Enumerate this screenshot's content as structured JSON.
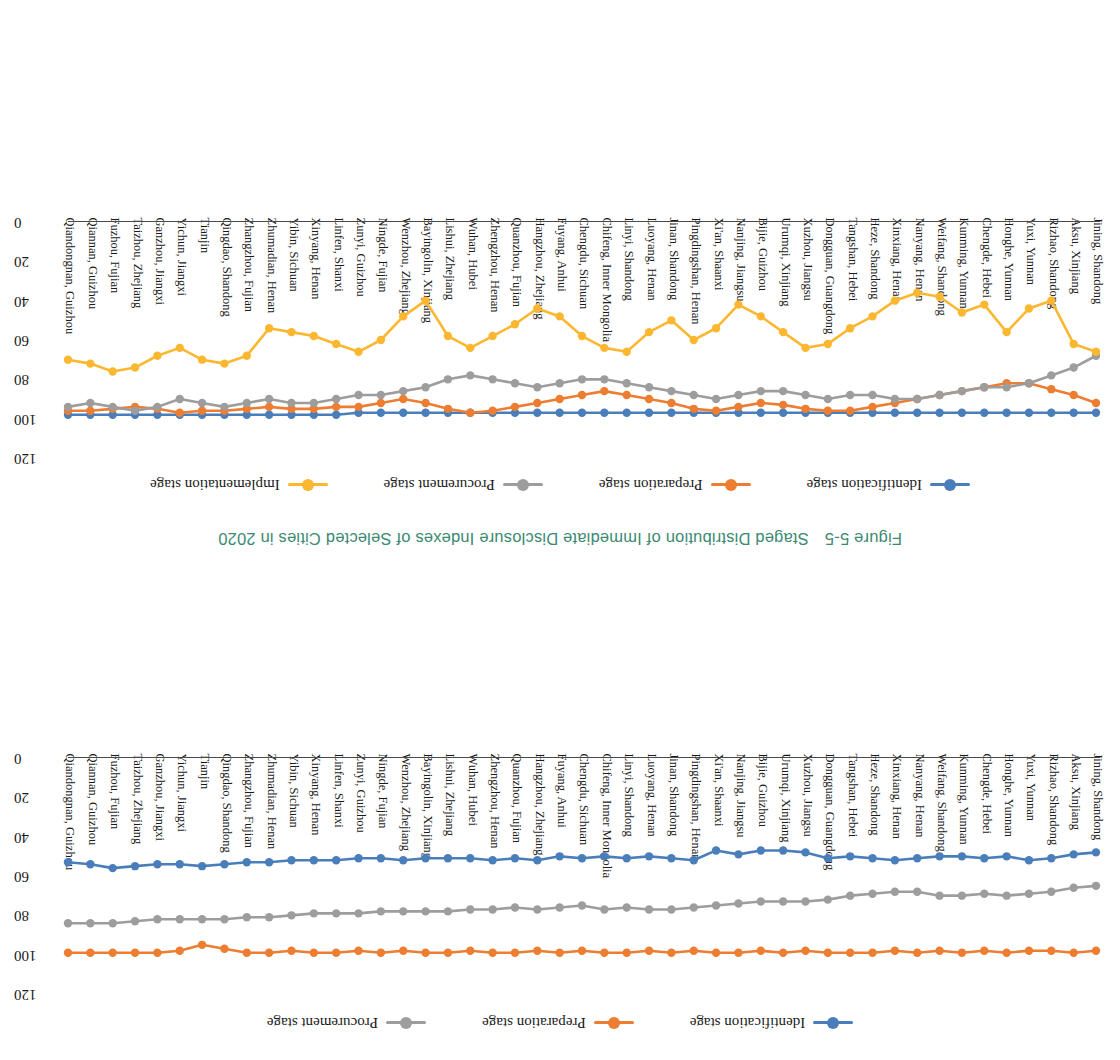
{
  "caption": {
    "number": "Figure 5-5",
    "title": "Staged Distribution of Immediate Disclosure Indexes of Selected Cities in 2020",
    "color": "#3c8a72"
  },
  "colors": {
    "identification": "#4a7ebb",
    "preparation": "#ed7d31",
    "procurement": "#9d9d9d",
    "implementation": "#fcb731"
  },
  "categories": [
    "Jining, Shandong",
    "Aksu, Xinjiang",
    "Rizhao, Shandong",
    "Yuxi, Yunnan",
    "Honghe, Yunnan",
    "Chengde, Hebei",
    "Kunming, Yunnan",
    "Weifang, Shandong",
    "Nanyang, Henan",
    "Xinxiang, Henan",
    "Heze, Shandong",
    "Tangshan, Hebei",
    "Dongguan, Guangdong",
    "Xuzhou, Jiangsu",
    "Urumqi, Xinjiang",
    "Bijie, Guizhou",
    "Nanjing, Jiangsu",
    "Xi'an, Shaanxi",
    "Pingdingshan, Henan",
    "Jinan, Shandong",
    "Luoyang, Henan",
    "Linyi, Shandong",
    "Chifeng, Inner Mongolia",
    "Chengdu, Sichuan",
    "Fuyang, Anhui",
    "Hangzhou, Zhejiang",
    "Quanzhou, Fujian",
    "Zhengzhou, Henan",
    "Wuhan, Hubei",
    "Lishui, Zhejiang",
    "Bayingolin, Xinjiang",
    "Wenzhou, Zhejiang",
    "Ningde, Fujian",
    "Zunyi, Guizhou",
    "Linfen, Shanxi",
    "Xinyang, Henan",
    "Yibin, Sichuan",
    "Zhumadian, Henan",
    "Zhangzhou, Fujian",
    "Qingdao, Shandong",
    "Tianjin",
    "Yichun, Jiangxi",
    "Ganzhou, Jiangxi",
    "Taizhou, Zhejiang",
    "Fuzhou, Fujian",
    "Qiannan, Guizhou",
    "Qiandongnan, Guizhou"
  ],
  "chart_data": [
    {
      "id": "top",
      "type": "line",
      "title": "",
      "xlabel": "",
      "ylabel": "",
      "ylim": [
        0,
        120
      ],
      "yticks": [
        0,
        20,
        40,
        60,
        80,
        100,
        120
      ],
      "grid": false,
      "legend_position": "top",
      "legend": [
        "Identification stage",
        "Preparation stage",
        "Procurement stage"
      ],
      "series": [
        {
          "name": "Identification stage",
          "color": "#4a7ebb",
          "values": [
            48,
            49,
            51,
            52,
            50,
            51,
            50,
            50,
            51,
            52,
            51,
            50,
            51,
            48,
            47,
            47,
            49,
            47,
            52,
            51,
            50,
            51,
            50,
            51,
            50,
            52,
            51,
            52,
            51,
            51,
            51,
            52,
            51,
            51,
            52,
            52,
            52,
            53,
            53,
            54,
            55,
            54,
            54,
            55,
            56,
            54,
            53
          ]
        },
        {
          "name": "Preparation stage",
          "color": "#ed7d31",
          "values": [
            98,
            99,
            98,
            98,
            99,
            98,
            99,
            98,
            99,
            98,
            99,
            99,
            99,
            98,
            99,
            98,
            99,
            99,
            98,
            99,
            98,
            99,
            99,
            98,
            99,
            98,
            99,
            99,
            98,
            99,
            99,
            98,
            99,
            98,
            99,
            99,
            98,
            99,
            99,
            97,
            95,
            98,
            99,
            99,
            99,
            99,
            99
          ]
        },
        {
          "name": "Procurement stage",
          "color": "#9d9d9d",
          "values": [
            65,
            66,
            68,
            69,
            70,
            69,
            70,
            70,
            68,
            68,
            69,
            70,
            72,
            73,
            73,
            73,
            74,
            75,
            76,
            77,
            77,
            76,
            77,
            75,
            76,
            77,
            76,
            77,
            77,
            78,
            78,
            78,
            78,
            79,
            79,
            79,
            80,
            81,
            81,
            82,
            82,
            82,
            82,
            83,
            84,
            84,
            84
          ]
        }
      ]
    },
    {
      "id": "bottom",
      "type": "line",
      "title": "",
      "xlabel": "",
      "ylabel": "",
      "ylim": [
        0,
        120
      ],
      "yticks": [
        0,
        20,
        40,
        60,
        80,
        100,
        120
      ],
      "grid": false,
      "legend_position": "top",
      "legend": [
        "Identification stage",
        "Preparation stage",
        "Procurement stage",
        "Implementation stage"
      ],
      "series": [
        {
          "name": "Identification stage",
          "color": "#4a7ebb",
          "values": [
            97,
            97,
            97,
            97,
            97,
            97,
            97,
            97,
            97,
            97,
            97,
            97,
            97,
            97,
            97,
            97,
            97,
            97,
            97,
            97,
            97,
            97,
            97,
            97,
            97,
            97,
            97,
            97,
            97,
            97,
            97,
            97,
            97,
            97,
            98,
            98,
            98,
            98,
            98,
            98,
            98,
            98,
            98,
            98,
            98,
            98,
            98
          ]
        },
        {
          "name": "Preparation stage",
          "color": "#ed7d31",
          "values": [
            92,
            88,
            85,
            82,
            82,
            84,
            86,
            88,
            90,
            92,
            94,
            96,
            96,
            95,
            93,
            92,
            94,
            96,
            95,
            92,
            90,
            88,
            86,
            88,
            90,
            92,
            94,
            96,
            97,
            95,
            92,
            90,
            92,
            94,
            94,
            95,
            95,
            94,
            95,
            96,
            96,
            97,
            95,
            94,
            95,
            96,
            96
          ]
        },
        {
          "name": "Procurement stage",
          "color": "#9d9d9d",
          "values": [
            68,
            74,
            78,
            82,
            84,
            84,
            86,
            88,
            90,
            90,
            88,
            88,
            90,
            88,
            86,
            86,
            88,
            90,
            88,
            86,
            84,
            82,
            80,
            80,
            82,
            84,
            82,
            80,
            78,
            80,
            84,
            86,
            88,
            88,
            90,
            92,
            92,
            90,
            92,
            94,
            92,
            90,
            94,
            96,
            94,
            92,
            94
          ]
        },
        {
          "name": "Implementation stage",
          "color": "#fcb731",
          "values": [
            66,
            62,
            40,
            44,
            56,
            42,
            46,
            38,
            36,
            40,
            48,
            54,
            62,
            64,
            56,
            48,
            42,
            54,
            60,
            50,
            56,
            66,
            64,
            58,
            48,
            44,
            52,
            58,
            64,
            58,
            40,
            48,
            60,
            66,
            62,
            58,
            56,
            54,
            68,
            72,
            70,
            64,
            68,
            74,
            76,
            72,
            70
          ]
        }
      ]
    }
  ]
}
